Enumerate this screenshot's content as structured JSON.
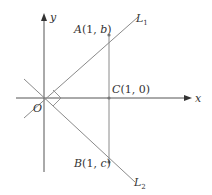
{
  "diagram": {
    "axes": {
      "x_label": "x",
      "y_label": "y",
      "origin_label": "O"
    },
    "lines": [
      {
        "name": "L",
        "subscript": "1"
      },
      {
        "name": "L",
        "subscript": "2"
      }
    ],
    "points": {
      "A": {
        "letter": "A",
        "coords": "(1, b)",
        "open": "(1, ",
        "var": "b",
        "close": ")"
      },
      "B": {
        "letter": "B",
        "coords": "(1, c)",
        "open": "(1, ",
        "var": "c",
        "close": ")"
      },
      "C": {
        "letter": "C",
        "coords": "(1, 0)",
        "text": "(1, 0)"
      }
    },
    "colors": {
      "axis": "#555555",
      "line": "#8a8a8a",
      "text": "#333333"
    }
  }
}
